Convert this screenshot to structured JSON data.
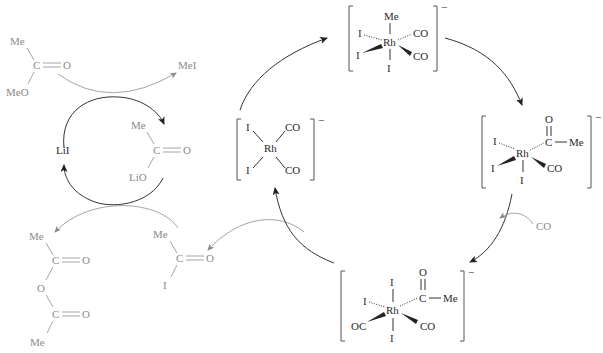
{
  "diagram": {
    "type": "catalytic-cycle",
    "colors": {
      "outer_species": "#8a8a8a",
      "rhodium_cycle": "#2a2a2a"
    },
    "organics": {
      "methyl_acetate": {
        "top": "Me",
        "center": "C",
        "double_bond_to": "O",
        "bottom": "MeO"
      },
      "methyl_iodide": {
        "label": "MeI"
      },
      "lithium_acetate": {
        "top": "Me",
        "center": "C",
        "double_bond_to": "O",
        "bottom": "LiO"
      },
      "lithium_iodide": {
        "label": "LiI"
      },
      "acetic_anhydride": {
        "top": "Me",
        "c1": "C",
        "o1": "O",
        "bridge": "O",
        "c2": "C",
        "o2": "O",
        "bottom": "Me"
      },
      "acetyl_iodide": {
        "top": "Me",
        "center": "C",
        "double_bond_to": "O",
        "bottom": "I"
      },
      "carbon_monoxide": {
        "label": "CO"
      }
    },
    "complexes": {
      "rh_square_planar": {
        "metal": "Rh",
        "ligands": [
          "I",
          "I",
          "CO",
          "CO"
        ],
        "charge": "−"
      },
      "rh_methyl": {
        "metal": "Rh",
        "ligands": [
          "Me",
          "I",
          "I",
          "CO",
          "CO",
          "I"
        ],
        "charge": "−"
      },
      "rh_acyl": {
        "metal": "Rh",
        "ligands": [
          "I",
          "I",
          "I",
          "CO"
        ],
        "acyl_o": "O",
        "acyl_c": "C",
        "acyl_me": "Me",
        "charge": "−"
      },
      "rh_acyl_co": {
        "metal": "Rh",
        "ligands": [
          "I",
          "I",
          "I",
          "OC",
          "CO"
        ],
        "acyl_o": "O",
        "acyl_c": "C",
        "acyl_me": "Me",
        "charge": "−"
      }
    }
  }
}
